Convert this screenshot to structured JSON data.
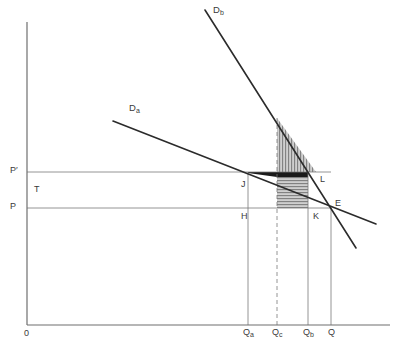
{
  "figure": {
    "type": "economics-diagram",
    "title": "",
    "axes": {
      "origin_label": "0",
      "y_axis_name": "price-axis",
      "x_axis_name": "quantity-axis"
    }
  },
  "curves": [
    {
      "id": "Da",
      "label": "D",
      "sub": "a",
      "name": "demand-curve-a",
      "x1": 113,
      "y1": 121,
      "x2": 376,
      "y2": 224
    },
    {
      "id": "Db",
      "label": "D",
      "sub": "b",
      "name": "demand-curve-b",
      "x1": 205,
      "y1": 10,
      "x2": 356,
      "y2": 248
    }
  ],
  "price_lines": [
    {
      "id": "Pprime",
      "label": "P",
      "sub": "′",
      "y": 172,
      "name": "price-line-p-prime"
    },
    {
      "id": "P",
      "label": "P",
      "sub": "",
      "y": 208,
      "name": "price-line-p"
    }
  ],
  "quantity_lines": [
    {
      "id": "Qa",
      "label": "Q",
      "sub": "a",
      "x": 248,
      "dashed": false,
      "top": 172
    },
    {
      "id": "Qc",
      "label": "Q",
      "sub": "c",
      "x": 277,
      "dashed": true,
      "top": 172
    },
    {
      "id": "Qb",
      "label": "Q",
      "sub": "b",
      "x": 308,
      "dashed": false,
      "top": 172
    },
    {
      "id": "Q",
      "label": "Q",
      "sub": "",
      "x": 331,
      "dashed": false,
      "top": 207
    }
  ],
  "point_labels": [
    {
      "id": "T",
      "text": "T",
      "x": 34,
      "y": 186,
      "name": "region-label-t"
    },
    {
      "id": "J",
      "text": "J",
      "x": 241,
      "y": 181,
      "name": "point-label-j"
    },
    {
      "id": "H",
      "text": "H",
      "x": 241,
      "y": 213,
      "name": "point-label-h"
    },
    {
      "id": "K",
      "text": "K",
      "x": 313,
      "y": 213,
      "name": "point-label-k"
    },
    {
      "id": "L",
      "text": "L",
      "x": 320,
      "y": 176,
      "name": "point-label-l"
    },
    {
      "id": "E",
      "text": "E",
      "x": 334,
      "y": 200,
      "name": "point-label-e"
    }
  ],
  "axis_labels": {
    "origin": "0",
    "y_ticks": [
      {
        "text": "P",
        "sub": "′",
        "x": 10,
        "y": 167
      },
      {
        "text": "P",
        "sub": "",
        "x": 10,
        "y": 203
      }
    ],
    "x_ticks": [
      {
        "text": "Q",
        "sub": "a",
        "x": 243,
        "y": 329
      },
      {
        "text": "Q",
        "sub": "c",
        "x": 272,
        "y": 329
      },
      {
        "text": "Q",
        "sub": "b",
        "x": 303,
        "y": 329
      },
      {
        "text": "Q",
        "sub": "",
        "x": 327,
        "y": 329
      }
    ]
  },
  "curve_labels": [
    {
      "text": "D",
      "sub": "b",
      "x": 213,
      "y": 6,
      "name": "curve-label-db"
    },
    {
      "text": "D",
      "sub": "a",
      "x": 129,
      "y": 104,
      "name": "curve-label-da"
    }
  ],
  "shaded_regions": [
    {
      "id": "vertical-hatch-triangle",
      "style": "vertical-hatch",
      "description": "triangle above P' bounded by Qc line, Db curve and P' line"
    },
    {
      "id": "horizontal-hatch-rect",
      "style": "horizontal-hatch",
      "description": "rectangle Qc-Qb between P and P'"
    },
    {
      "id": "black-triangle",
      "style": "solid-black",
      "description": "small filled triangle from J along P' to Qc"
    }
  ],
  "colors": {
    "line": "#2b2b2b",
    "axis": "#6f6f6f",
    "thin": "#7a7a7a",
    "text": "#3a3a3a",
    "hatch": "#8d8d8d",
    "fill": "#c9c9c9",
    "black": "#1a1a1a",
    "background": "#ffffff"
  }
}
